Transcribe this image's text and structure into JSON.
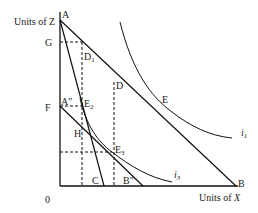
{
  "diagram": {
    "axes": {
      "y_label": "Units of Z",
      "x_label_prefix": "Units of ",
      "x_label_var": "X",
      "origin": "0"
    },
    "points": {
      "A": "A",
      "B": "B",
      "G": "G",
      "F": "F",
      "A2": "A\"",
      "B2": "B\"",
      "C": "C",
      "D": "D",
      "D1": "D",
      "D1_sub": "1",
      "E": "E",
      "E2": "E",
      "E2_sub": "2",
      "E3": "E",
      "E3_sub": "3",
      "H": "H"
    },
    "curves": {
      "i1": "i",
      "i1_sub": "1",
      "i3": "i",
      "i3_sub": "3"
    },
    "colors": {
      "line": "#111111",
      "background": "#ffffff"
    }
  }
}
